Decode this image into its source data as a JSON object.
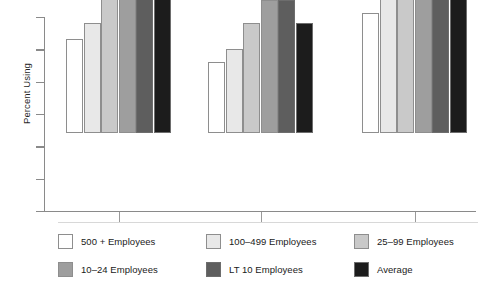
{
  "chart_data": {
    "type": "bar",
    "title": "",
    "subtitle": "",
    "xlabel": "",
    "ylabel": "Percent Using",
    "grid": false,
    "legend_position": "bottom",
    "axis": {
      "y_tick_count": 7,
      "y_tick_labels": [
        "",
        "",
        "",
        "",
        "",
        "",
        ""
      ],
      "x_tick_labels": [
        "",
        "",
        ""
      ],
      "ylim": [
        0,
        60
      ],
      "y_tick_values": [
        0,
        10,
        20,
        30,
        40,
        50,
        60
      ]
    },
    "categories": [
      "Group 1",
      "Group 2",
      "Group 3"
    ],
    "series": [
      {
        "name": "500 + Employees",
        "color": "#ffffff",
        "values": [
          29,
          22,
          37
        ]
      },
      {
        "name": "100–499 Employees",
        "color": "#e8e8e8",
        "values": [
          34,
          26,
          45
        ]
      },
      {
        "name": "25–99 Employees",
        "color": "#c9c9c9",
        "values": [
          43,
          34,
          44
        ]
      },
      {
        "name": "10–24 Employees",
        "color": "#9e9e9e",
        "values": [
          51,
          41,
          48
        ]
      },
      {
        "name": "LT 10 Employees",
        "color": "#5e5e5e",
        "values": [
          52,
          41,
          53
        ]
      },
      {
        "name": "Average",
        "color": "#1c1c1c",
        "values": [
          43,
          34,
          45
        ]
      }
    ]
  },
  "legend": {
    "items": [
      {
        "label": "500 + Employees",
        "color": "#ffffff"
      },
      {
        "label": "100–499 Employees",
        "color": "#e8e8e8"
      },
      {
        "label": "25–99 Employees",
        "color": "#c9c9c9"
      },
      {
        "label": "10–24 Employees",
        "color": "#9e9e9e"
      },
      {
        "label": "LT 10 Employees",
        "color": "#5e5e5e"
      },
      {
        "label": "Average",
        "color": "#1c1c1c"
      }
    ]
  }
}
